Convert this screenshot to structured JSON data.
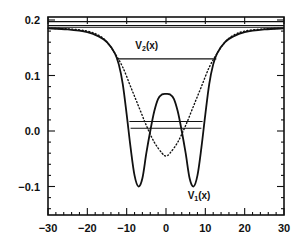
{
  "chart_data": {
    "type": "line",
    "title": "",
    "xlabel": "",
    "ylabel": "",
    "xlim": [
      -30,
      30
    ],
    "ylim": [
      -0.145,
      0.205
    ],
    "grid": false,
    "legend": "none",
    "x_ticks": [
      -30,
      -20,
      -10,
      0,
      10,
      20,
      30
    ],
    "x_tick_labels": [
      "-30",
      "-20",
      "-10",
      "0",
      "10",
      "20",
      "30"
    ],
    "y_ticks": [
      -0.1,
      0.0,
      0.1,
      0.2
    ],
    "y_tick_labels": [
      "-0.1",
      "0.0",
      "0.1",
      "0.2"
    ],
    "series": [
      {
        "name": "V1(x)",
        "style": "solid",
        "description": "double-well potential, minima near x=±7 at ≈-0.10, central barrier ≈0.067 at x=0, asymptote ≈0.185",
        "x": [
          -30,
          -25,
          -20,
          -17,
          -15,
          -13,
          -12,
          -11,
          -10,
          -9,
          -8,
          -7,
          -6,
          -5,
          -4,
          -3,
          -2,
          -1,
          0,
          1,
          2,
          3,
          4,
          5,
          6,
          7,
          8,
          9,
          10,
          11,
          12,
          13,
          15,
          17,
          20,
          25,
          30
        ],
        "y": [
          0.185,
          0.183,
          0.178,
          0.17,
          0.16,
          0.14,
          0.12,
          0.085,
          0.03,
          -0.03,
          -0.08,
          -0.1,
          -0.085,
          -0.04,
          0.0,
          0.035,
          0.058,
          0.066,
          0.067,
          0.066,
          0.058,
          0.035,
          0.0,
          -0.04,
          -0.085,
          -0.1,
          -0.08,
          -0.03,
          0.03,
          0.085,
          0.12,
          0.14,
          0.16,
          0.17,
          0.178,
          0.183,
          0.185
        ]
      },
      {
        "name": "V2(x)",
        "style": "dotted",
        "description": "single-well potential, minimum ≈-0.045 at x=0",
        "x": [
          -30,
          -25,
          -20,
          -17,
          -15,
          -13,
          -11,
          -9,
          -7,
          -5,
          -3,
          -1,
          0,
          1,
          3,
          5,
          7,
          9,
          11,
          13,
          15,
          17,
          20,
          25,
          30
        ],
        "y": [
          0.185,
          0.184,
          0.18,
          0.172,
          0.16,
          0.14,
          0.115,
          0.08,
          0.045,
          0.01,
          -0.02,
          -0.04,
          -0.045,
          -0.04,
          -0.02,
          0.01,
          0.045,
          0.08,
          0.115,
          0.14,
          0.16,
          0.172,
          0.18,
          0.184,
          0.185
        ]
      }
    ],
    "levels": [
      {
        "y": 0.197,
        "x_from": -30,
        "x_to": 30
      },
      {
        "y": 0.19,
        "x_from": -30,
        "x_to": 30
      },
      {
        "y": 0.187,
        "x_from": -30,
        "x_to": 30
      },
      {
        "y": 0.13,
        "x_from": -12.5,
        "x_to": 12.8
      },
      {
        "y": 0.017,
        "x_from": -9.3,
        "x_to": 9.3
      },
      {
        "y": 0.005,
        "x_from": -9.0,
        "x_to": 9.0
      }
    ],
    "annotations": [
      {
        "text": "V",
        "sub": "2",
        "suffix": "(x)",
        "x": -7.8,
        "y": 0.148
      },
      {
        "text": "V",
        "sub": "1",
        "suffix": "(x)",
        "x": 5.5,
        "y": -0.122
      }
    ]
  },
  "colors": {
    "ink": "#111111",
    "background": "#ffffff"
  }
}
